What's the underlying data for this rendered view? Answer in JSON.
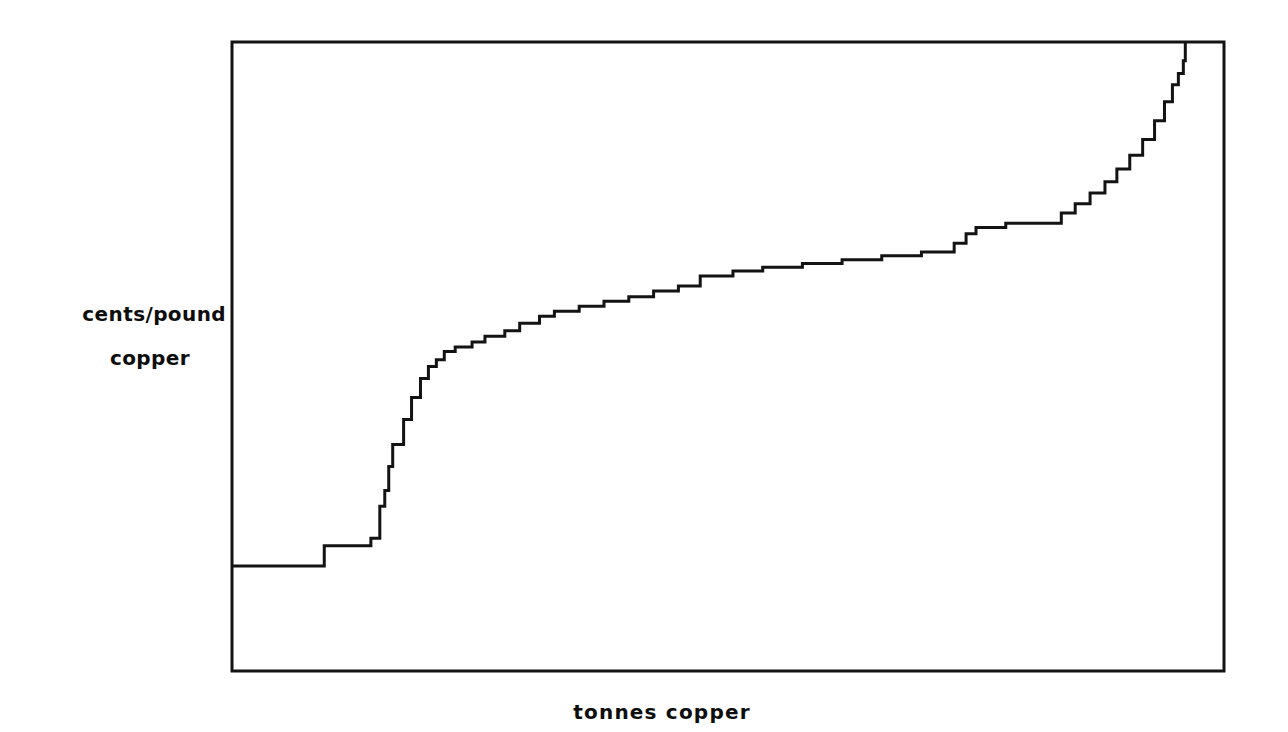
{
  "figure": {
    "name": "copper-supply-cost-curve",
    "background_color": "#ffffff",
    "line_color": "#131313"
  },
  "axis_labels": {
    "y_line1": "cents/pound",
    "y_line2": "copper",
    "x": "tonnes copper"
  },
  "chart_data": {
    "type": "line",
    "title": "",
    "subtitle": "",
    "xlabel": "tonnes copper",
    "ylabel": "cents/pound copper",
    "grid": false,
    "legend": null,
    "axis_ticks": {
      "x": [],
      "y": []
    },
    "xlim": [
      0,
      100
    ],
    "ylim": [
      0,
      100
    ],
    "series": [
      {
        "name": "cumulative copper supply cost curve",
        "step": "post",
        "x": [
          0.0,
          9.3,
          9.3,
          14.0,
          14.0,
          14.9,
          14.9,
          15.4,
          15.4,
          15.8,
          15.8,
          16.2,
          16.2,
          17.3,
          17.3,
          18.1,
          18.1,
          19.0,
          19.0,
          19.8,
          19.8,
          20.6,
          20.6,
          21.4,
          21.4,
          22.5,
          22.5,
          24.2,
          24.2,
          25.5,
          25.5,
          27.5,
          27.5,
          29.0,
          29.0,
          31.0,
          31.0,
          32.5,
          32.5,
          35.0,
          35.0,
          37.5,
          37.5,
          40.0,
          40.0,
          42.5,
          42.5,
          45.0,
          45.0,
          47.2,
          47.2,
          50.5,
          50.5,
          53.5,
          53.5,
          57.5,
          57.5,
          61.5,
          61.5,
          65.5,
          65.5,
          69.5,
          69.5,
          72.8,
          72.8,
          74.0,
          74.0,
          75.0,
          75.0,
          78.0,
          78.0,
          83.6,
          83.6,
          85.0,
          85.0,
          86.5,
          86.5,
          88.0,
          88.0,
          89.2,
          89.2,
          90.5,
          90.5,
          91.8,
          91.8,
          93.0,
          93.0,
          94.0,
          94.0,
          94.8,
          94.8,
          95.4,
          95.4,
          95.9,
          95.9,
          96.1,
          96.1,
          96.1
        ],
        "y": [
          16.7,
          16.7,
          19.9,
          19.9,
          21.1,
          21.1,
          26.2,
          26.2,
          28.7,
          28.7,
          32.5,
          32.5,
          36.0,
          36.0,
          40.0,
          40.0,
          43.5,
          43.5,
          46.5,
          46.5,
          48.4,
          48.4,
          49.5,
          49.5,
          50.8,
          50.8,
          51.5,
          51.5,
          52.3,
          52.3,
          53.2,
          53.2,
          54.1,
          54.1,
          55.3,
          55.3,
          56.4,
          56.4,
          57.2,
          57.2,
          58.0,
          58.0,
          58.8,
          58.8,
          59.5,
          59.5,
          60.4,
          60.4,
          61.2,
          61.2,
          62.8,
          62.8,
          63.6,
          63.6,
          64.2,
          64.2,
          64.8,
          64.8,
          65.4,
          65.4,
          66.0,
          66.0,
          66.6,
          66.6,
          68.0,
          68.0,
          69.5,
          69.5,
          70.5,
          70.5,
          71.2,
          71.2,
          72.8,
          72.8,
          74.3,
          74.3,
          76.0,
          76.0,
          77.8,
          77.8,
          79.8,
          79.8,
          82.0,
          82.0,
          84.5,
          84.5,
          87.5,
          87.5,
          90.5,
          90.5,
          93.2,
          93.2,
          95.0,
          95.0,
          97.0,
          97.0,
          100.0,
          100.0
        ]
      }
    ]
  }
}
